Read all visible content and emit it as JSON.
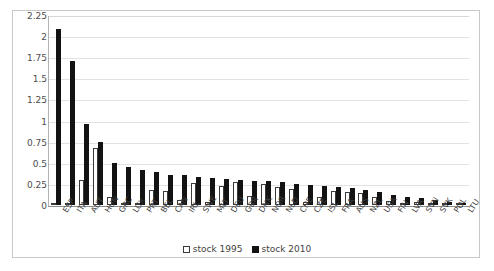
{
  "chart_data": {
    "type": "bar",
    "title": "",
    "subtitle": "",
    "xlabel": "",
    "ylabel": "",
    "ylim": [
      0,
      2.25
    ],
    "yticks": [
      "0",
      "0.25",
      "0.5",
      "0.75",
      "1",
      "1.25",
      "1.5",
      "1.75",
      "2",
      "2.25"
    ],
    "ytick_values": [
      0,
      0.25,
      0.5,
      0.75,
      1,
      1.25,
      1.5,
      1.75,
      2,
      2.25
    ],
    "grid": true,
    "legend_position": "bottom",
    "categories": [
      "ESP",
      "ITA",
      "AUT",
      "HUN",
      "GRC",
      "LUX",
      "PRT",
      "BEL",
      "CAN",
      "IRL",
      "SWE",
      "MLT",
      "DEU",
      "GBR",
      "DNK",
      "NOR",
      "NLD",
      "CHE",
      "CZE",
      "ISL",
      "FRA",
      "AUS",
      "NZL",
      "USA",
      "FIN",
      "LVA",
      "SVN",
      "SVK",
      "POL",
      "LTU"
    ],
    "series": [
      {
        "name": "stock 1995",
        "color": "#ffffff",
        "edge_color": "#3a3a3a",
        "values": [
          0.02,
          0.02,
          0.3,
          0.67,
          0.1,
          0.02,
          0.02,
          0.18,
          0.17,
          0.06,
          0.26,
          0.03,
          0.22,
          0.27,
          0.11,
          0.25,
          0.21,
          0.19,
          0.04,
          0.09,
          0.17,
          0.16,
          0.14,
          0.1,
          0.05,
          0.02,
          0.04,
          0.02,
          0.01,
          0.01
        ]
      },
      {
        "name": "stock 2010",
        "color": "#131313",
        "edge_color": "#131313",
        "values": [
          2.09,
          1.7,
          0.96,
          0.75,
          0.5,
          0.45,
          0.42,
          0.39,
          0.36,
          0.35,
          0.33,
          0.32,
          0.31,
          0.3,
          0.29,
          0.28,
          0.27,
          0.25,
          0.24,
          0.23,
          0.21,
          0.2,
          0.18,
          0.16,
          0.12,
          0.1,
          0.08,
          0.06,
          0.04,
          0.02
        ]
      }
    ]
  },
  "legend": {
    "entries": [
      {
        "label": "stock 1995",
        "swatch": "open-square-icon"
      },
      {
        "label": "stock 2010",
        "swatch": "filled-square-icon"
      }
    ]
  }
}
